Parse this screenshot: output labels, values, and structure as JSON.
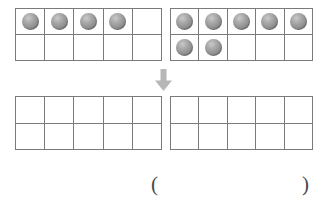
{
  "page": {
    "background_color": "#ffffff",
    "frame_border_color": "#7a7a7a",
    "counter_color": "#8f8f8f",
    "arrow_color": "#b3b3b3",
    "paren_color": "#4a4a4a"
  },
  "frames": {
    "top_left": {
      "name": "Addend A ten frame",
      "count": 4,
      "rows": [
        [
          "filled",
          "filled",
          "filled",
          "filled",
          "empty"
        ],
        [
          "empty",
          "empty",
          "empty",
          "empty",
          "empty"
        ]
      ]
    },
    "top_right": {
      "name": "Addend B ten frame",
      "count": 7,
      "rows": [
        [
          "filled",
          "filled",
          "filled",
          "filled",
          "filled"
        ],
        [
          "filled",
          "filled",
          "empty",
          "empty",
          "empty"
        ]
      ]
    },
    "bottom_left": {
      "name": "Answer ten frame one",
      "count": 0,
      "rows": [
        [
          "empty",
          "empty",
          "empty",
          "empty",
          "empty"
        ],
        [
          "empty",
          "empty",
          "empty",
          "empty",
          "empty"
        ]
      ]
    },
    "bottom_right": {
      "name": "Answer ten frame two",
      "count": 0,
      "rows": [
        [
          "empty",
          "empty",
          "empty",
          "empty",
          "empty"
        ],
        [
          "empty",
          "empty",
          "empty",
          "empty",
          "empty"
        ]
      ]
    }
  },
  "arrow": {
    "icon": "arrow-down-icon",
    "direction": "down"
  },
  "answer": {
    "open_paren": "(",
    "close_paren": ")",
    "value": "",
    "placeholder": ""
  }
}
